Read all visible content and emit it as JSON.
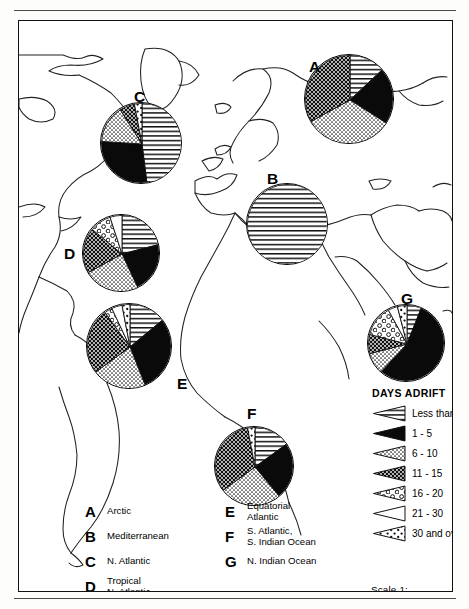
{
  "figure": {
    "scale_note": "Scale  1: 65,000,000",
    "legend_title": "DAYS ADRIFT"
  },
  "legend": {
    "items": [
      {
        "key": "less_than_1",
        "label": "Less than 1",
        "pattern": "horizontal-lines"
      },
      {
        "key": "1_5",
        "label": "1 - 5",
        "pattern": "solid-black"
      },
      {
        "key": "6_10",
        "label": "6 - 10",
        "pattern": "fine-stipple"
      },
      {
        "key": "11_15",
        "label": "11 - 15",
        "pattern": "dark-crosshatch"
      },
      {
        "key": "16_20",
        "label": "16 - 20",
        "pattern": "bubbles"
      },
      {
        "key": "21_30",
        "label": "21 - 30",
        "pattern": "white"
      },
      {
        "key": "30_over",
        "label": "30 and over",
        "pattern": "coarse-stipple"
      }
    ]
  },
  "regions": {
    "left_column": [
      {
        "letter": "A",
        "name": "Arctic"
      },
      {
        "letter": "B",
        "name": "Mediterranean"
      },
      {
        "letter": "C",
        "name": "N. Atlantic"
      },
      {
        "letter": "D",
        "name": "Tropical\nN. Atlantic"
      }
    ],
    "right_column": [
      {
        "letter": "E",
        "name": "Equatorial\nAtlantic"
      },
      {
        "letter": "F",
        "name": "S. Atlantic,\nS. Indian Ocean"
      },
      {
        "letter": "G",
        "name": "N. Indian Ocean"
      }
    ]
  },
  "chart_data": {
    "type": "pie",
    "legend_position": "right-lower",
    "categories": [
      "Less than 1",
      "1 - 5",
      "6 - 10",
      "11 - 15",
      "16 - 20",
      "21 - 30",
      "30 and over"
    ],
    "category_patterns": [
      "horizontal-lines",
      "solid-black",
      "fine-stipple",
      "dark-crosshatch",
      "bubbles",
      "white",
      "coarse-stipple"
    ],
    "units": "percent of observations",
    "series": [
      {
        "name": "A",
        "region": "Arctic",
        "cx": 330,
        "cy": 78,
        "r": 45,
        "values": [
          13,
          21,
          33,
          33,
          0,
          0,
          0
        ]
      },
      {
        "name": "B",
        "region": "Mediterranean",
        "cx": 268,
        "cy": 203,
        "r": 41,
        "values": [
          100,
          0,
          0,
          0,
          0,
          0,
          0
        ]
      },
      {
        "name": "C",
        "region": "N. Atlantic",
        "cx": 122,
        "cy": 122,
        "r": 41,
        "values": [
          48,
          28,
          15,
          6,
          0,
          0,
          3
        ]
      },
      {
        "name": "D",
        "region": "Tropical N. Atlantic",
        "cx": 102,
        "cy": 232,
        "r": 39,
        "values": [
          21,
          22,
          24,
          19,
          9,
          5,
          0
        ]
      },
      {
        "name": "E",
        "region": "Equatorial Atlantic",
        "cx": 110,
        "cy": 325,
        "r": 43,
        "values": [
          14,
          30,
          21,
          25,
          3,
          4,
          3
        ]
      },
      {
        "name": "F",
        "region": "S. Atlantic, S. Indian Ocean",
        "cx": 235,
        "cy": 445,
        "r": 40,
        "values": [
          15,
          24,
          26,
          32,
          0,
          0,
          3
        ]
      },
      {
        "name": "G",
        "region": "N. Indian Ocean",
        "cx": 387,
        "cy": 322,
        "r": 39,
        "values": [
          6,
          56,
          9,
          8,
          13,
          4,
          4
        ]
      }
    ],
    "labels": [
      {
        "name": "A",
        "x": 290,
        "y": 38
      },
      {
        "name": "B",
        "x": 248,
        "y": 150
      },
      {
        "name": "C",
        "x": 115,
        "y": 68
      },
      {
        "name": "D",
        "x": 45,
        "y": 225
      },
      {
        "name": "E",
        "x": 158,
        "y": 355
      },
      {
        "name": "F",
        "x": 228,
        "y": 385
      },
      {
        "name": "G",
        "x": 382,
        "y": 270
      }
    ]
  }
}
